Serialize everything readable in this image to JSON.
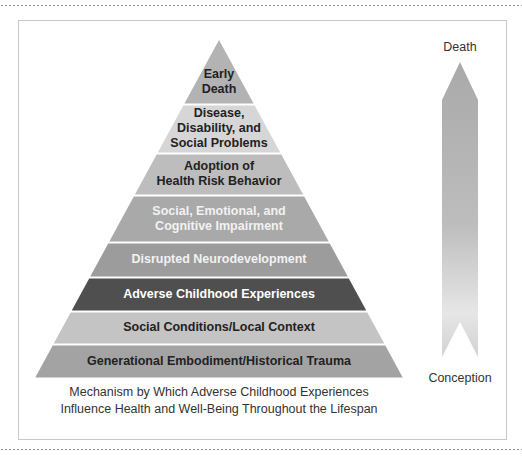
{
  "figure": {
    "caption_lines": [
      "Mechanism by Which Adverse Childhood Experiences",
      "Influence Health and Well-Being Throughout the Lifespan"
    ],
    "arrow": {
      "top_label": "Death",
      "bottom_label": "Conception",
      "gradient_top": "#a9a9a9",
      "gradient_bottom": "#e2e2e2"
    },
    "pyramid_layers": [
      {
        "lines": [
          "Early",
          "Death"
        ],
        "fill": "#b3b3b3",
        "text_color": "#222222"
      },
      {
        "lines": [
          "Disease,",
          "Disability, and",
          "Social Problems"
        ],
        "fill": "#d6d6d6",
        "text_color": "#222222"
      },
      {
        "lines": [
          "Adoption of",
          "Health Risk Behavior"
        ],
        "fill": "#bdbdbd",
        "text_color": "#222222"
      },
      {
        "lines": [
          "Social, Emotional, and",
          "Cognitive Impairment"
        ],
        "fill": "#a9a9a9",
        "text_color": "#f2f2f2"
      },
      {
        "lines": [
          "Disrupted Neurodevelopment"
        ],
        "fill": "#9c9c9c",
        "text_color": "#f2f2f2"
      },
      {
        "lines": [
          "Adverse Childhood Experiences"
        ],
        "fill": "#4f4f4f",
        "text_color": "#ffffff"
      },
      {
        "lines": [
          "Social Conditions/Local Context"
        ],
        "fill": "#c4c4c4",
        "text_color": "#222222"
      },
      {
        "lines": [
          "Generational Embodiment/Historical Trauma"
        ],
        "fill": "#a3a3a3",
        "text_color": "#222222"
      }
    ]
  }
}
